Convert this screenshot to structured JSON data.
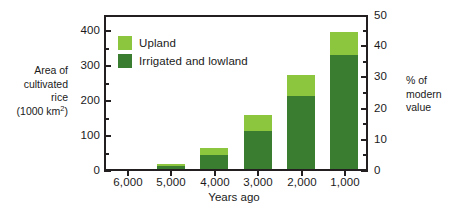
{
  "chart_data": {
    "type": "bar",
    "title": "",
    "subtitle": "",
    "stacked": true,
    "orientation": "vertical",
    "grid": false,
    "categories": [
      "6,000",
      "5,000",
      "4,000",
      "3,000",
      "2,000",
      "1,000"
    ],
    "series": [
      {
        "name": "Irrigated and lowland",
        "color": "#3a7d30",
        "values": [
          0,
          10,
          40,
          110,
          212,
          330
        ]
      },
      {
        "name": "Upland",
        "color": "#8cc63e",
        "values": [
          0,
          5,
          20,
          45,
          60,
          65
        ]
      }
    ],
    "totals": [
      0,
      15,
      60,
      155,
      272,
      395
    ],
    "xlabel": "Years ago",
    "ylabel": "Area of cultivated rice (1000 km2)",
    "ylabel_lines": [
      "Area of",
      "cultivated",
      "rice",
      "(1000 km"
    ],
    "ylabel_sup": "2",
    "ylabel_tail": ")",
    "ylim": [
      0,
      450
    ],
    "yticks": [
      "0",
      "100",
      "200",
      "300",
      "400"
    ],
    "ytick_values": [
      0,
      100,
      200,
      300,
      400
    ],
    "yminor_step": 50,
    "y2label": "% of modern value",
    "y2label_lines": [
      "% of",
      "modern",
      "value"
    ],
    "y2lim": [
      0,
      50
    ],
    "y2ticks": [
      "0",
      "10",
      "20",
      "30",
      "40",
      "50"
    ],
    "y2tick_values": [
      0,
      10,
      20,
      30,
      40,
      50
    ],
    "y2minor_step": 5,
    "legend_position": "inside-top-left",
    "legend": [
      {
        "label": "Upland",
        "color": "#8cc63e"
      },
      {
        "label": "Irrigated and lowland",
        "color": "#3a7d30"
      }
    ],
    "axis_color": "#231f20",
    "background": "#ffffff"
  }
}
